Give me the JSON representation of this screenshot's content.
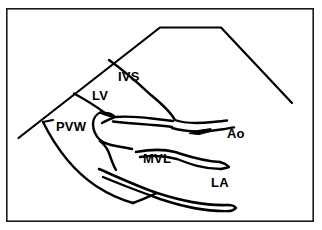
{
  "figure": {
    "domain": "Diagram",
    "kind": "echocardiogram-schematic",
    "background_color": "#ffffff",
    "ink_color": "#000000",
    "frame": {
      "name": "figure-border",
      "color": "#1a1a1a",
      "x": 6,
      "y": 8,
      "width": 308,
      "height": 214,
      "stroke_width": 1.6
    },
    "labels": [
      {
        "id": "ivs",
        "text": "IVS",
        "meaning": "interventricular septum",
        "x": 118,
        "y": 80,
        "font_size": 13
      },
      {
        "id": "lv",
        "text": "LV",
        "meaning": "left ventricle",
        "x": 92,
        "y": 99,
        "font_size": 13
      },
      {
        "id": "pvw",
        "text": "PVW",
        "meaning": "posterior ventricular wall",
        "x": 56,
        "y": 130,
        "font_size": 13
      },
      {
        "id": "ao",
        "text": "Ao",
        "meaning": "aorta",
        "x": 227,
        "y": 138,
        "font_size": 13
      },
      {
        "id": "mvl",
        "text": "MVL",
        "meaning": "mitral valve leaflet",
        "x": 143,
        "y": 162,
        "font_size": 13
      },
      {
        "id": "la",
        "text": "LA",
        "meaning": "left atrium",
        "x": 211,
        "y": 186,
        "font_size": 13
      }
    ],
    "markers": [
      {
        "id": "ao-arrow",
        "name": "aorta-pointer-arrow",
        "direction": "left",
        "x": 196,
        "y": 133
      }
    ],
    "strokes": {
      "sector_outline": "M 18 138 L 160 27 L 221 27 L 292 103",
      "ivs_curve": "M 108 60 C 128 74 140 86 152 96 C 163 105 170 112 174 120",
      "lv_inner": "M 74 93 C 90 103 100 110 108 117",
      "ivs_lower_a": "M 174 120 C 184 124 196 124 216 122",
      "ivs_lower_b": "M 170 128 C 186 132 200 132 222 128",
      "mvl_anterior": "M 128 112 C 146 112 160 114 176 116",
      "mvl_upper": "M 136 148 C 158 146 170 148 182 152 C 194 156 206 160 222 160",
      "mvl_lower": "M 139 153 C 160 152 172 154 184 158 C 196 163 208 167 224 167",
      "pvw_outer": "M 43 122 C 62 152 86 182 124 198",
      "la_post_a": "M 100 168 C 120 176 136 184 160 192 C 186 200 208 205 232 204",
      "la_post_b": "M 104 176 C 124 184 140 190 162 198 C 188 206 210 211 234 210"
    }
  }
}
